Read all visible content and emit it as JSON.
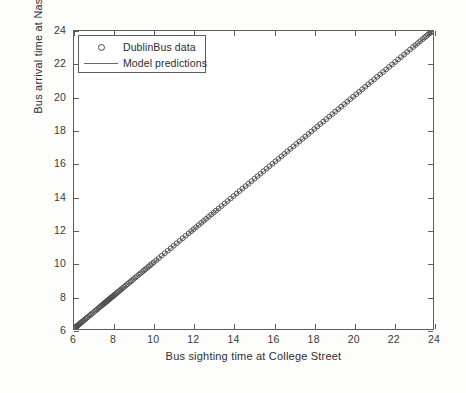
{
  "chart_data": {
    "type": "scatter",
    "title": "",
    "xlabel": "Bus sighting time at College Street",
    "ylabel": "Bus arrival time at Nassau Street",
    "xlim": [
      6,
      24
    ],
    "ylim": [
      6,
      24
    ],
    "xticks": [
      6,
      8,
      10,
      12,
      14,
      16,
      18,
      20,
      22,
      24
    ],
    "yticks": [
      6,
      8,
      10,
      12,
      14,
      16,
      18,
      20,
      22,
      24
    ],
    "xticklabels": [
      "6",
      "8",
      "10",
      "12",
      "14",
      "16",
      "18",
      "20",
      "22",
      "24"
    ],
    "yticklabels": [
      "6",
      "8",
      "10",
      "12",
      "14",
      "16",
      "18",
      "20",
      "22",
      "24"
    ],
    "grid": false,
    "legend_position": "upper left",
    "legend": [
      {
        "label": "DublinBus data",
        "marker": "circle",
        "style": "open-circle",
        "color": "#4a4a4a"
      },
      {
        "label": "Model predictions",
        "marker": "line",
        "style": "solid-line",
        "color": "#6b6b6b"
      }
    ],
    "series": [
      {
        "name": "DublinBus data",
        "type": "scatter",
        "marker": "o",
        "marker_size": 5,
        "color": "#4a4a4a",
        "x": [
          6.05,
          6.08,
          6.1,
          6.12,
          6.15,
          6.18,
          6.22,
          6.26,
          6.3,
          6.35,
          6.4,
          6.46,
          6.52,
          6.58,
          6.64,
          6.7,
          6.78,
          6.85,
          6.92,
          7.0,
          7.08,
          7.15,
          7.22,
          7.28,
          7.34,
          7.4,
          7.45,
          7.5,
          7.54,
          7.58,
          7.62,
          7.66,
          7.7,
          7.74,
          7.78,
          7.82,
          7.86,
          7.9,
          7.94,
          7.98,
          8.03,
          8.08,
          8.14,
          8.2,
          8.26,
          8.32,
          8.38,
          8.45,
          8.52,
          8.6,
          8.68,
          8.76,
          8.84,
          8.92,
          9.0,
          9.08,
          9.16,
          9.25,
          9.34,
          9.42,
          9.5,
          9.58,
          9.66,
          9.74,
          9.82,
          9.9,
          10.0,
          10.12,
          10.25,
          10.4,
          10.55,
          10.7,
          10.85,
          11.0,
          11.15,
          11.3,
          11.45,
          11.6,
          11.75,
          11.88,
          12.0,
          12.12,
          12.25,
          12.38,
          12.5,
          12.62,
          12.75,
          12.88,
          13.0,
          13.12,
          13.25,
          13.4,
          13.55,
          13.7,
          13.85,
          14.0,
          14.15,
          14.3,
          14.45,
          14.6,
          14.75,
          14.9,
          15.05,
          15.2,
          15.35,
          15.5,
          15.65,
          15.8,
          15.95,
          16.1,
          16.25,
          16.4,
          16.55,
          16.7,
          16.85,
          17.0,
          17.15,
          17.3,
          17.45,
          17.6,
          17.75,
          17.9,
          18.05,
          18.2,
          18.35,
          18.5,
          18.65,
          18.8,
          18.95,
          19.1,
          19.25,
          19.4,
          19.55,
          19.7,
          19.85,
          20.0,
          20.15,
          20.3,
          20.45,
          20.6,
          20.75,
          20.9,
          21.05,
          21.2,
          21.35,
          21.5,
          21.65,
          21.8,
          21.95,
          22.1,
          22.25,
          22.4,
          22.55,
          22.7,
          22.85,
          23.0,
          23.12,
          23.24,
          23.36,
          23.48,
          23.58,
          23.66,
          23.74,
          23.82,
          23.88,
          23.93,
          23.97
        ],
        "y": [
          6.07,
          6.1,
          6.12,
          6.15,
          6.17,
          6.21,
          6.25,
          6.29,
          6.33,
          6.38,
          6.43,
          6.49,
          6.55,
          6.61,
          6.67,
          6.73,
          6.81,
          6.88,
          6.95,
          7.03,
          7.11,
          7.18,
          7.25,
          7.31,
          7.37,
          7.43,
          7.48,
          7.53,
          7.57,
          7.61,
          7.65,
          7.69,
          7.73,
          7.77,
          7.81,
          7.85,
          7.89,
          7.93,
          7.97,
          8.01,
          8.06,
          8.11,
          8.17,
          8.23,
          8.29,
          8.35,
          8.41,
          8.48,
          8.55,
          8.63,
          8.71,
          8.79,
          8.87,
          8.95,
          9.03,
          9.11,
          9.19,
          9.28,
          9.37,
          9.45,
          9.53,
          9.61,
          9.69,
          9.77,
          9.85,
          9.93,
          10.03,
          10.15,
          10.28,
          10.43,
          10.58,
          10.73,
          10.88,
          11.03,
          11.18,
          11.33,
          11.48,
          11.63,
          11.78,
          11.91,
          12.03,
          12.15,
          12.28,
          12.41,
          12.53,
          12.65,
          12.78,
          12.91,
          13.03,
          13.15,
          13.28,
          13.43,
          13.58,
          13.73,
          13.88,
          14.03,
          14.18,
          14.33,
          14.48,
          14.63,
          14.78,
          14.93,
          15.08,
          15.23,
          15.38,
          15.53,
          15.68,
          15.83,
          15.98,
          16.13,
          16.28,
          16.43,
          16.58,
          16.73,
          16.88,
          17.03,
          17.18,
          17.33,
          17.48,
          17.63,
          17.78,
          17.93,
          18.08,
          18.23,
          18.38,
          18.53,
          18.68,
          18.83,
          18.98,
          19.13,
          19.28,
          19.43,
          19.58,
          19.73,
          19.88,
          20.03,
          20.18,
          20.33,
          20.48,
          20.63,
          20.78,
          20.93,
          21.08,
          21.23,
          21.38,
          21.53,
          21.68,
          21.83,
          21.98,
          22.13,
          22.28,
          22.43,
          22.58,
          22.73,
          22.88,
          23.03,
          23.15,
          23.27,
          23.39,
          23.51,
          23.61,
          23.69,
          23.77,
          23.85,
          23.91,
          23.96,
          24.0
        ]
      },
      {
        "name": "Model predictions",
        "type": "line",
        "color": "#6b6b6b",
        "linewidth": 1,
        "x": [
          6,
          24
        ],
        "y": [
          6,
          24
        ]
      }
    ]
  }
}
